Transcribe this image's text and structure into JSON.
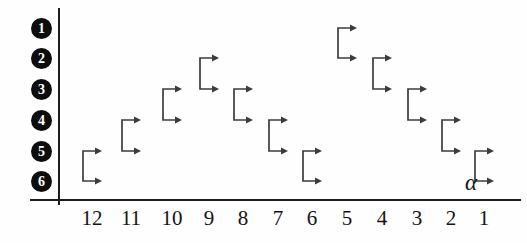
{
  "figure": {
    "title": "",
    "x_axis_name": "α",
    "row_labels": [
      "1",
      "2",
      "3",
      "4",
      "5",
      "6"
    ],
    "column_labels": [
      "12",
      "11",
      "10",
      "9",
      "8",
      "7",
      "6",
      "5",
      "4",
      "3",
      "2",
      "1"
    ],
    "colors": {
      "axis": "#1d1d1d",
      "mark": "#3c3c3c",
      "label_disc": "#0d0d0d",
      "label_text": "#ffffff",
      "tick_text": "#131313",
      "background": "#ffffff"
    }
  },
  "chart_data": {
    "type": "scatter",
    "title": "",
    "xlabel": "α",
    "ylabel": "",
    "grid": false,
    "legend": "none",
    "x_tick_labels": [
      "12",
      "11",
      "10",
      "9",
      "8",
      "7",
      "6",
      "5",
      "4",
      "3",
      "2",
      "1"
    ],
    "y_tick_labels": [
      "1",
      "2",
      "3",
      "4",
      "5",
      "6"
    ],
    "ylim": [
      1,
      6
    ],
    "y_axis_inverted": true,
    "marker": "bracket-with-two-right-arrows",
    "series": [
      {
        "name": "transition",
        "points": [
          {
            "alpha": "12",
            "from_row": 5,
            "to_row": 6
          },
          {
            "alpha": "11",
            "from_row": 4,
            "to_row": 5
          },
          {
            "alpha": "10",
            "from_row": 3,
            "to_row": 4
          },
          {
            "alpha": "9",
            "from_row": 2,
            "to_row": 3
          },
          {
            "alpha": "8",
            "from_row": 3,
            "to_row": 4
          },
          {
            "alpha": "7",
            "from_row": 4,
            "to_row": 5
          },
          {
            "alpha": "6",
            "from_row": 5,
            "to_row": 6
          },
          {
            "alpha": "5",
            "from_row": 1,
            "to_row": 2
          },
          {
            "alpha": "4",
            "from_row": 2,
            "to_row": 3
          },
          {
            "alpha": "3",
            "from_row": 3,
            "to_row": 4
          },
          {
            "alpha": "2",
            "from_row": 4,
            "to_row": 5
          },
          {
            "alpha": "1",
            "from_row": 5,
            "to_row": 6
          }
        ]
      }
    ]
  },
  "geometry": {
    "y_axis": {
      "x": 58,
      "y_top": 8,
      "y_bottom": 205
    },
    "x_axis": {
      "y": 199,
      "x_left": 30,
      "x_right": 521
    },
    "row_y": [
      28,
      58,
      89,
      120,
      151,
      181
    ],
    "col_x": [
      92,
      131,
      172,
      209,
      243,
      278,
      312,
      347,
      382,
      417,
      451,
      484
    ],
    "row_label_x": 31,
    "axis_name": {
      "x": 465,
      "y": 170
    }
  }
}
